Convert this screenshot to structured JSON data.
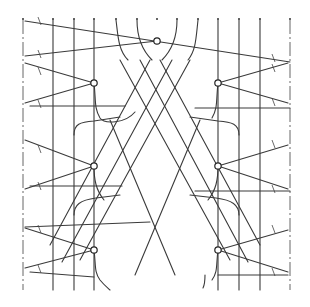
{
  "diagram": {
    "type": "line-drawing",
    "colors": {
      "line": "#3a3a3a",
      "background": "#ffffff"
    },
    "nodes": [
      {
        "id": "n-top",
        "x": 157,
        "y": 41
      },
      {
        "id": "n-left-1",
        "x": 94,
        "y": 83
      },
      {
        "id": "n-left-2",
        "x": 94,
        "y": 166
      },
      {
        "id": "n-left-3",
        "x": 94,
        "y": 250
      },
      {
        "id": "n-right-1",
        "x": 218,
        "y": 83
      },
      {
        "id": "n-right-2",
        "x": 218,
        "y": 166
      },
      {
        "id": "n-right-3",
        "x": 218,
        "y": 250
      }
    ],
    "vertical_rails_x": [
      23,
      53,
      74,
      94,
      116,
      137,
      157,
      177,
      198,
      218,
      239,
      260,
      290
    ]
  }
}
